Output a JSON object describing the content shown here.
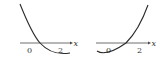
{
  "graphs": [
    {
      "name": "left",
      "axis_label": "x",
      "tick_labels": [
        "0",
        "2"
      ],
      "description": "Downward-opening-from-left parabola crossing x-axis between 0 and 2, minimum to the right near x=2"
    },
    {
      "name": "right",
      "axis_label": "x",
      "tick_labels": [
        "0",
        "2"
      ],
      "description": "Upward parabola with minimum left of 0, crossing x-axis between 0 and 2 and rising steeply"
    }
  ],
  "colors": {
    "line": "#2a2a2a",
    "axis": "#4a4a4a",
    "text": "#333333"
  }
}
